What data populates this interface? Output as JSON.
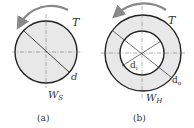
{
  "figure_a": {
    "torque_label": "T",
    "diameter_label": "d",
    "section_modulus_label": "W",
    "section_modulus_sub": "S",
    "caption": "(a)"
  },
  "figure_b": {
    "torque_label": "T",
    "inner_diameter_label": "d",
    "inner_diameter_sub": "i",
    "outer_diameter_label": "d",
    "outer_diameter_sub": "o",
    "section_modulus_label": "W",
    "section_modulus_sub": "H",
    "caption": "(b)"
  },
  "colors": {
    "fill": "#e8e8e8",
    "stroke": "#222222",
    "arrow": "#888888"
  }
}
